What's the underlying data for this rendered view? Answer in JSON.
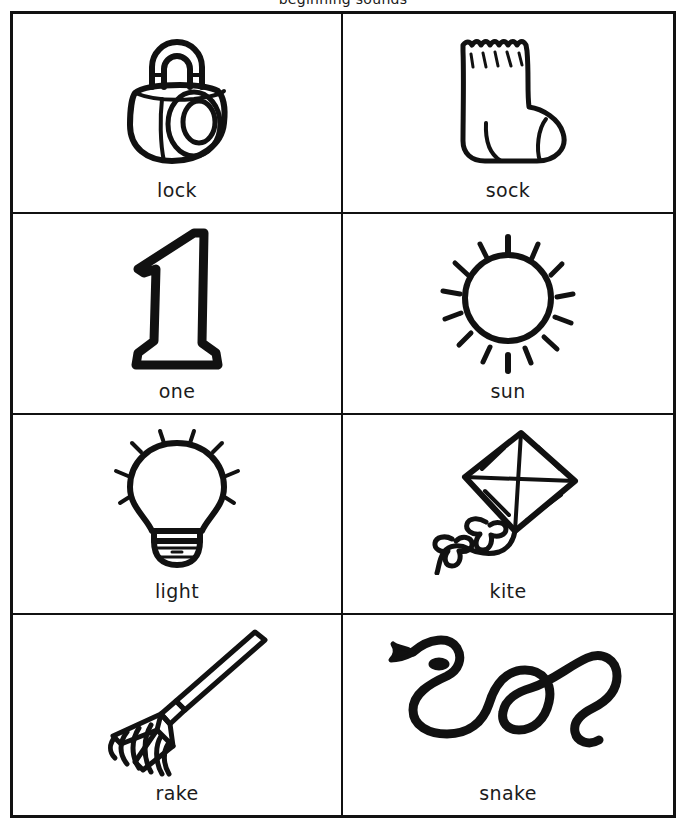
{
  "worksheet": {
    "top_partial_text": "beginning sounds",
    "background_color": "#ffffff",
    "ink_color": "#111111",
    "border_color": "#111111",
    "columns": 2,
    "rows": 4
  },
  "cells": [
    {
      "id": "cell-lock",
      "label": "lock",
      "icon": "padlock-icon",
      "row": 1,
      "col": 1
    },
    {
      "id": "cell-sock",
      "label": "sock",
      "icon": "sock-icon",
      "row": 1,
      "col": 2
    },
    {
      "id": "cell-one",
      "label": "one",
      "icon": "numeral-one-icon",
      "row": 2,
      "col": 1
    },
    {
      "id": "cell-sun",
      "label": "sun",
      "icon": "sun-icon",
      "row": 2,
      "col": 2
    },
    {
      "id": "cell-light",
      "label": "light",
      "icon": "lightbulb-icon",
      "row": 3,
      "col": 1
    },
    {
      "id": "cell-kite",
      "label": "kite",
      "icon": "kite-icon",
      "row": 3,
      "col": 2
    },
    {
      "id": "cell-rake",
      "label": "rake",
      "icon": "rake-icon",
      "row": 4,
      "col": 1
    },
    {
      "id": "cell-snake",
      "label": "snake",
      "icon": "snake-icon",
      "row": 4,
      "col": 2
    }
  ]
}
